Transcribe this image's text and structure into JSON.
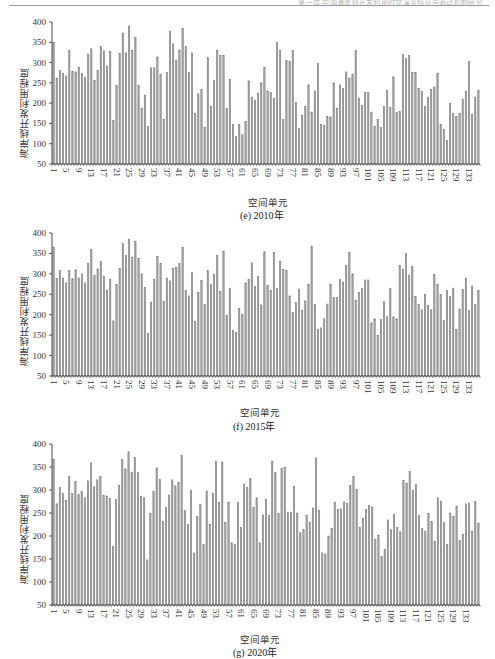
{
  "page": {
    "header_text": "第一章  中国海岸线开发利用时空演变特征与驱动机制研究"
  },
  "colors": {
    "bar_fill": "#a9a9a9",
    "bar_stroke": "#6e6e6e",
    "axis": "#333333"
  },
  "chart_data": [
    {
      "id": "e",
      "type": "bar",
      "caption": "(e) 2010年",
      "title": "",
      "xlabel": "空间单元",
      "ylabel": "海岸线开发利用程度",
      "ylim": [
        50,
        400
      ],
      "yticks": [
        50,
        100,
        150,
        200,
        250,
        300,
        350,
        400
      ],
      "xtick_labels": [
        "1",
        "5",
        "9",
        "13",
        "17",
        "21",
        "25",
        "29",
        "33",
        "37",
        "41",
        "45",
        "49",
        "53",
        "57",
        "61",
        "65",
        "69",
        "73",
        "77",
        "81",
        "85",
        "89",
        "93",
        "97",
        "101",
        "105",
        "109",
        "113",
        "117",
        "121",
        "125",
        "129",
        "133"
      ],
      "grid": false,
      "legend": "none",
      "categories_range": [
        1,
        136
      ],
      "values": [
        350,
        262,
        280,
        274,
        267,
        330,
        279,
        277,
        289,
        274,
        264,
        321,
        334,
        256,
        280,
        339,
        329,
        292,
        327,
        157,
        244,
        323,
        373,
        324,
        390,
        330,
        362,
        243,
        188,
        220,
        143,
        287,
        287,
        314,
        271,
        160,
        276,
        378,
        346,
        306,
        331,
        384,
        340,
        276,
        324,
        174,
        223,
        234,
        141,
        312,
        192,
        256,
        330,
        318,
        318,
        187,
        259,
        148,
        118,
        148,
        122,
        155,
        255,
        215,
        207,
        225,
        250,
        288,
        230,
        226,
        212,
        350,
        330,
        160,
        305,
        303,
        330,
        201,
        137,
        170,
        192,
        245,
        178,
        230,
        298,
        148,
        145,
        168,
        166,
        250,
        188,
        245,
        236,
        277,
        262,
        270,
        330,
        212,
        195,
        227,
        226,
        178,
        143,
        160,
        140,
        192,
        232,
        190,
        265,
        177,
        180,
        320,
        310,
        318,
        276,
        276,
        237,
        229,
        192,
        215,
        234,
        240,
        274,
        148,
        135,
        108,
        200,
        175,
        167,
        175,
        210,
        230,
        303,
        172,
        215,
        232
      ]
    },
    {
      "id": "f",
      "type": "bar",
      "caption": "(f) 2015年",
      "title": "",
      "xlabel": "空间单元",
      "ylabel": "海岸线开发利用程度",
      "ylim": [
        50,
        400
      ],
      "yticks": [
        50,
        100,
        150,
        200,
        250,
        300,
        350,
        400
      ],
      "xtick_labels": [
        "1",
        "5",
        "9",
        "13",
        "17",
        "21",
        "25",
        "29",
        "33",
        "37",
        "41",
        "45",
        "49",
        "53",
        "57",
        "61",
        "65",
        "69",
        "73",
        "77",
        "81",
        "85",
        "89",
        "93",
        "97",
        "101",
        "105",
        "109",
        "113",
        "117",
        "121",
        "125",
        "129",
        "133"
      ],
      "grid": false,
      "legend": "none",
      "categories_range": [
        1,
        136
      ],
      "values": [
        365,
        289,
        308,
        290,
        278,
        308,
        288,
        310,
        290,
        300,
        278,
        325,
        360,
        296,
        312,
        330,
        294,
        260,
        287,
        185,
        274,
        313,
        374,
        345,
        384,
        341,
        380,
        338,
        300,
        267,
        155,
        231,
        287,
        342,
        325,
        232,
        290,
        283,
        313,
        316,
        325,
        365,
        260,
        246,
        304,
        183,
        254,
        284,
        225,
        308,
        275,
        299,
        345,
        257,
        355,
        199,
        265,
        162,
        157,
        216,
        201,
        278,
        287,
        327,
        269,
        293,
        224,
        354,
        272,
        260,
        353,
        265,
        331,
        311,
        308,
        246,
        206,
        230,
        263,
        210,
        234,
        275,
        368,
        225,
        164,
        168,
        190,
        226,
        275,
        242,
        242,
        286,
        280,
        320,
        352,
        300,
        236,
        255,
        265,
        285,
        285,
        180,
        190,
        150,
        188,
        232,
        195,
        265,
        195,
        190,
        321,
        312,
        350,
        297,
        318,
        245,
        225,
        212,
        250,
        222,
        212,
        298,
        275,
        250,
        186,
        260,
        244,
        265,
        164,
        214,
        262,
        290,
        210,
        270,
        225,
        260
      ]
    },
    {
      "id": "g",
      "type": "bar",
      "caption": "(g) 2020年",
      "title": "",
      "xlabel": "空间单元",
      "ylabel": "海岸线开发利用程度",
      "ylim": [
        50,
        400
      ],
      "yticks": [
        50,
        100,
        150,
        200,
        250,
        300,
        350,
        400
      ],
      "xtick_labels": [
        "1",
        "5",
        "9",
        "13",
        "17",
        "21",
        "25",
        "29",
        "33",
        "37",
        "41",
        "45",
        "49",
        "53",
        "57",
        "61",
        "65",
        "69",
        "73",
        "77",
        "81",
        "85",
        "89",
        "93",
        "97",
        "101",
        "105",
        "109",
        "113",
        "117",
        "121",
        "125",
        "129",
        "133"
      ],
      "grid": false,
      "legend": "none",
      "categories_range": [
        1,
        136
      ],
      "values": [
        367,
        270,
        305,
        292,
        278,
        329,
        293,
        318,
        290,
        297,
        283,
        320,
        359,
        307,
        322,
        329,
        288,
        287,
        282,
        177,
        279,
        310,
        366,
        346,
        383,
        339,
        371,
        338,
        286,
        283,
        148,
        249,
        297,
        348,
        323,
        232,
        263,
        289,
        322,
        309,
        317,
        375,
        255,
        225,
        299,
        163,
        242,
        268,
        181,
        298,
        226,
        293,
        363,
        273,
        361,
        230,
        274,
        185,
        182,
        273,
        219,
        313,
        305,
        325,
        262,
        283,
        185,
        246,
        280,
        245,
        363,
        338,
        249,
        347,
        350,
        252,
        252,
        308,
        250,
        207,
        214,
        245,
        229,
        261,
        370,
        256,
        163,
        161,
        200,
        217,
        274,
        258,
        259,
        274,
        271,
        310,
        330,
        301,
        219,
        239,
        258,
        266,
        263,
        192,
        202,
        155,
        171,
        235,
        214,
        247,
        218,
        209,
        321,
        315,
        340,
        300,
        312,
        245,
        216,
        210,
        249,
        232,
        188,
        283,
        276,
        229,
        182,
        250,
        243,
        265,
        190,
        204,
        270,
        272,
        210,
        275,
        228
      ]
    }
  ]
}
